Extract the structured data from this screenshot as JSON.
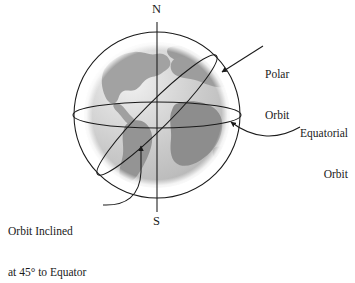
{
  "diagram": {
    "background_color": "#ffffff",
    "line_color": "#1a1a1a",
    "globe": {
      "ocean_color": "#c9c9c9",
      "ocean_highlight_color": "#efefef",
      "land_color": "#9a9a9a",
      "land_shadow_color": "#8a8a8a",
      "halo_color": "#ffffff",
      "center_x": 157,
      "center_y": 115,
      "radius": 75
    },
    "axis": {
      "name": "polar-axis",
      "north_label": "N",
      "south_label": "S",
      "top_y": 22,
      "bottom_y": 212
    },
    "orbits": [
      {
        "id": "polar",
        "name": "Polar Orbit",
        "type": "circle",
        "radius": 83,
        "inclination_deg": 90
      },
      {
        "id": "equatorial",
        "name": "Equatorial Orbit",
        "type": "ellipse",
        "semi_major": 84,
        "semi_minor": 13,
        "inclination_deg": 0
      },
      {
        "id": "inclined",
        "name": "Orbit Inclined at 45° to Equator",
        "type": "ellipse",
        "semi_major": 84,
        "semi_minor": 13,
        "inclination_deg": 45
      }
    ]
  },
  "labels": {
    "north_pole": "N",
    "south_pole": "S",
    "polar_orbit": {
      "line1": "Polar",
      "line2": "Orbit"
    },
    "equatorial_orbit": {
      "line1": "Equatorial",
      "line2": "Orbit"
    },
    "inclined_orbit": {
      "line1": "Orbit Inclined",
      "line2": "at 45° to Equator"
    }
  }
}
